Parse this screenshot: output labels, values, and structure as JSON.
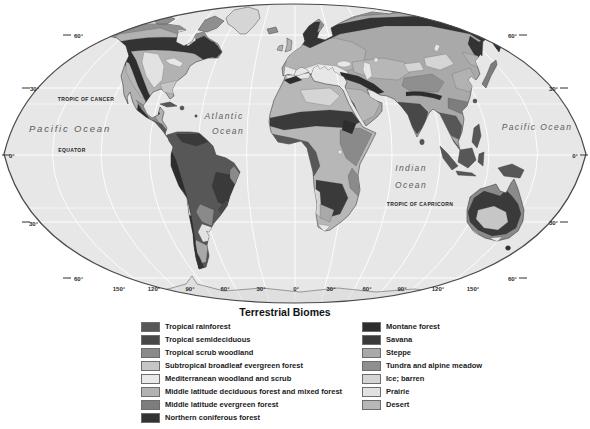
{
  "map": {
    "ocean_color": "#e7e7e7",
    "outline_color": "#4a4a4a",
    "labels": {
      "pacific_west": "Pacific Ocean",
      "pacific_east": "Pacific Ocean",
      "atlantic": [
        "Atlantic",
        "Ocean"
      ],
      "indian": [
        "Indian",
        "Ocean"
      ],
      "equator": "EQUATOR",
      "tropic_of_cancer": "TROPIC OF CANCER",
      "tropic_of_capricorn": "TROPIC OF CAPRICORN"
    },
    "lat_labels_left": [
      "60°",
      "30°",
      "0°",
      "30°",
      "60°"
    ],
    "lat_labels_right": [
      "60°",
      "30°",
      "0°",
      "30°",
      "60°"
    ],
    "lon_labels": [
      "150°",
      "120°",
      "90°",
      "60°",
      "30°",
      "0°",
      "30°",
      "60°",
      "90°",
      "120°",
      "150°"
    ]
  },
  "legend": {
    "title": "Terrestrial Biomes",
    "left": [
      {
        "label": "Tropical rainforest",
        "color": "#575757"
      },
      {
        "label": "Tropical semideciduous",
        "color": "#484848"
      },
      {
        "label": "Tropical scrub woodland",
        "color": "#8a8a8a"
      },
      {
        "label": "Subtropical broadleaf evergreen forest",
        "color": "#c6c6c6"
      },
      {
        "label": "Mediterranean woodland and scrub",
        "color": "#e9e9e9"
      },
      {
        "label": "Middle latitude deciduous forest and mixed forest",
        "color": "#b2b2b2"
      },
      {
        "label": "Middle latitude evergreen forest",
        "color": "#7d7d7d"
      },
      {
        "label": "Northern coniferous forest",
        "color": "#333333"
      }
    ],
    "right": [
      {
        "label": "Montane forest",
        "color": "#2d2d2d"
      },
      {
        "label": "Savana",
        "color": "#3a3a3a"
      },
      {
        "label": "Steppe",
        "color": "#a9a9a9"
      },
      {
        "label": "Tundra and alpine meadow",
        "color": "#8f8f8f"
      },
      {
        "label": "Ice; barren",
        "color": "#d5d5d5"
      },
      {
        "label": "Prairie",
        "color": "#e2e2e2"
      },
      {
        "label": "Desert",
        "color": "#b7b7b7"
      }
    ]
  }
}
